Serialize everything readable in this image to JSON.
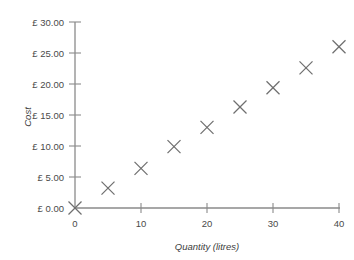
{
  "chart_data": {
    "type": "scatter",
    "title": "",
    "xlabel": "Quantity (litres)",
    "ylabel": "Cost",
    "xlim": [
      0,
      40
    ],
    "ylim": [
      0,
      30
    ],
    "grid": false,
    "legend": "none",
    "marker": "x",
    "marker_color": "#6f6f6f",
    "axis_color": "#8a8a8a",
    "background": "#ffffff",
    "x_ticks": [
      0,
      10,
      20,
      30,
      40
    ],
    "x_tick_labels": [
      "0",
      "10",
      "20",
      "30",
      "40"
    ],
    "x_minor_ticks": [
      5,
      15,
      25,
      35
    ],
    "y_ticks": [
      0,
      5,
      10,
      15,
      20,
      25,
      30
    ],
    "y_tick_labels": [
      "£ 0.00",
      "£ 5.00",
      "£ 10.00",
      "£ 15.00",
      "£ 20.00",
      "£ 25.00",
      "£ 30.00"
    ],
    "currency_symbol": "£",
    "x": [
      0,
      5,
      10,
      15,
      20,
      25,
      30,
      35,
      40
    ],
    "y": [
      0.0,
      3.2,
      6.4,
      9.9,
      13.0,
      16.3,
      19.4,
      22.6,
      26.0
    ],
    "points": [
      {
        "x": 0,
        "y": 0.0,
        "label": "£ 0.00"
      },
      {
        "x": 5,
        "y": 3.2,
        "label": "£ 3.20"
      },
      {
        "x": 10,
        "y": 6.4,
        "label": "£ 6.40"
      },
      {
        "x": 15,
        "y": 9.9,
        "label": "£ 9.90"
      },
      {
        "x": 20,
        "y": 13.0,
        "label": "£ 13.00"
      },
      {
        "x": 25,
        "y": 16.3,
        "label": "£ 16.30"
      },
      {
        "x": 30,
        "y": 19.4,
        "label": "£ 19.40"
      },
      {
        "x": 35,
        "y": 22.6,
        "label": "£ 22.60"
      },
      {
        "x": 40,
        "y": 26.0,
        "label": "£ 26.00"
      }
    ]
  },
  "axes": {
    "y_title": "Cost",
    "x_title": "Quantity (litres)",
    "y_labels": {
      "v30": "£ 30.00",
      "v25": "£ 25.00",
      "v20": "£ 20.00",
      "v15": "£ 15.00",
      "v10": "£ 10.00",
      "v5": "£ 5.00",
      "v0": "£ 0.00"
    },
    "x_labels": {
      "v0": "0",
      "v10": "10",
      "v20": "20",
      "v30": "30",
      "v40": "40"
    }
  }
}
